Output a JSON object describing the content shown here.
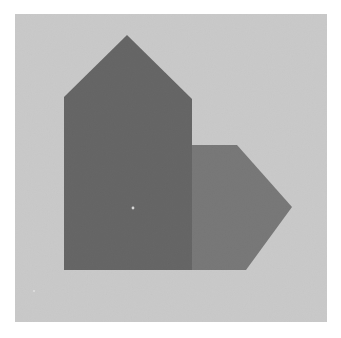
{
  "image": {
    "title": "Two overlapping polygons on a gray panel",
    "width": 341,
    "height": 338,
    "outer_background_color": "#ffffff"
  },
  "panel": {
    "label": "gray-paper-panel",
    "color": "#c9c9c9",
    "x": 15,
    "y": 14,
    "width": 312,
    "height": 308,
    "texture": "paper-grain-noise"
  },
  "shapes": [
    {
      "name": "dark-pentagon-house",
      "description": "Tall pentagon resembling a house or upward arrow block",
      "color": "#3a3a3a",
      "points": "127,35 192,99 192,270 64,270 64,97",
      "apex": {
        "x": 127,
        "y": 35
      },
      "bottom": 270,
      "left": 64,
      "right": 192,
      "z": 2
    },
    {
      "name": "gray-arrow-pentagon",
      "description": "Right-pointing pentagon arrow with chamfered right side",
      "color": "#545454",
      "points": "192,145 237,145 292,207 246,270 192,270",
      "tip": {
        "x": 292,
        "y": 207
      },
      "top": 145,
      "bottom": 270,
      "left": 192,
      "z": 1
    }
  ],
  "marks": [
    {
      "name": "white-speck",
      "description": "Small light speck inside the dark pentagon",
      "color": "#d8d8d8",
      "x": 133,
      "y": 208,
      "radius": 1.4
    },
    {
      "name": "white-speck-lower-left",
      "description": "Faint speck near lower-left of panel",
      "color": "#e4e4e4",
      "x": 34,
      "y": 291,
      "radius": 1.0
    }
  ],
  "palette": {
    "page": "#ffffff",
    "panel": "#c9c9c9",
    "dark_shape": "#3a3a3a",
    "mid_shape": "#545454",
    "speck": "#d8d8d8"
  }
}
